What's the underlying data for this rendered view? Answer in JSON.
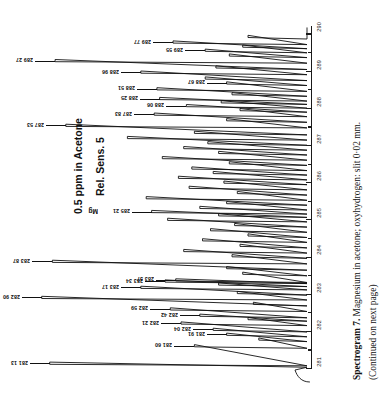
{
  "figure": {
    "annotation_line1": "0.5 ppm in Acetone",
    "annotation_line2": "Rel. Sens. 5",
    "caption_bold": "Spectrogram 7.",
    "caption_rest": " Magnesium in acetone; oxyhydrogen: slit 0·02 mm.",
    "caption_continued": "(Continued on next page)",
    "element_marker": "Mg"
  },
  "chart_data": {
    "type": "line",
    "title": "Spectrogram 7. Magnesium in acetone; oxyhydrogen: slit 0·02 mm.",
    "subtitle": "0.5 ppm in Acetone / Rel. Sens. 5",
    "xlabel": "Wavelength (nm)",
    "ylabel": "Relative intensity (chart recorder deflection)",
    "xlim": [
      281.0,
      290.2
    ],
    "ylim": [
      0,
      100
    ],
    "grid": false,
    "legend": null,
    "orientation": "rotated-180-vertical-axis-right",
    "axis_ticks_major": [
      281,
      282,
      283,
      284,
      285,
      286,
      287,
      288,
      289,
      290
    ],
    "axis_ticks_minor": [
      281.5,
      282.5,
      283.5,
      284.5,
      285.5,
      286.5,
      287.5,
      288.5,
      289.5
    ],
    "peak_labels": [
      {
        "label": "281 13",
        "wavelength": 281.13,
        "height": 96
      },
      {
        "label": "281 60",
        "wavelength": 281.6,
        "height": 42
      },
      {
        "label": "281 91",
        "wavelength": 281.91,
        "height": 30
      },
      {
        "label": "282 04",
        "wavelength": 282.04,
        "height": 35
      },
      {
        "label": "282 21",
        "wavelength": 282.21,
        "height": 47
      },
      {
        "label": "282 42",
        "wavelength": 282.42,
        "height": 40
      },
      {
        "label": "282 59",
        "wavelength": 282.59,
        "height": 51
      },
      {
        "label": "282 90",
        "wavelength": 282.9,
        "height": 99
      },
      {
        "label": "283 17",
        "wavelength": 283.17,
        "height": 62
      },
      {
        "label": "283 37",
        "wavelength": 283.37,
        "height": 49
      },
      {
        "label": "283 34",
        "wavelength": 283.34,
        "height": 53
      },
      {
        "label": "283 87",
        "wavelength": 283.87,
        "height": 95
      },
      {
        "label": "285 21",
        "wavelength": 285.21,
        "height": 58
      },
      {
        "label": "287 53",
        "wavelength": 287.53,
        "height": 90
      },
      {
        "label": "287 83",
        "wavelength": 287.83,
        "height": 57
      },
      {
        "label": "288 06",
        "wavelength": 288.06,
        "height": 45
      },
      {
        "label": "288 25",
        "wavelength": 288.25,
        "height": 55
      },
      {
        "label": "288 51",
        "wavelength": 288.51,
        "height": 56
      },
      {
        "label": "288 67",
        "wavelength": 288.67,
        "height": 30
      },
      {
        "label": "288 96",
        "wavelength": 288.96,
        "height": 62
      },
      {
        "label": "289 27",
        "wavelength": 289.27,
        "height": 94
      },
      {
        "label": "289 55",
        "wavelength": 289.55,
        "height": 38
      },
      {
        "label": "289 77",
        "wavelength": 289.77,
        "height": 50
      }
    ]
  }
}
